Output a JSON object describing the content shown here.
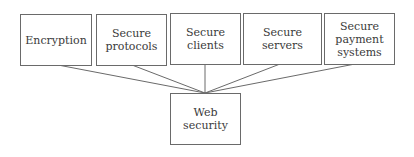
{
  "diagram": {
    "type": "hierarchy",
    "top_nodes": [
      {
        "label": "Encryption"
      },
      {
        "label": "Secure\nprotocols"
      },
      {
        "label": "Secure\nclients"
      },
      {
        "label": "Secure\nservers"
      },
      {
        "label": "Secure\npayment\nsystems"
      }
    ],
    "root_node": {
      "label": "Web security"
    },
    "edges": [
      [
        "Encryption",
        "Web security"
      ],
      [
        "Secure protocols",
        "Web security"
      ],
      [
        "Secure clients",
        "Web security"
      ],
      [
        "Secure servers",
        "Web security"
      ],
      [
        "Secure payment systems",
        "Web security"
      ]
    ],
    "colors": {
      "stroke": "#6a6a6a",
      "text": "#3a3a3a",
      "background": "#ffffff"
    }
  }
}
